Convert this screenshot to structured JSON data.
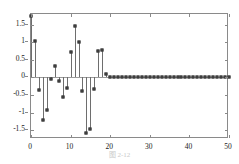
{
  "figure": {
    "caption": "图 2-12",
    "background_color": "#ffffff",
    "frame_color": "#8a8a8a",
    "stem_color": "#6e6e6e",
    "marker_color": "#4a4a4a"
  },
  "chart_data": {
    "type": "bar",
    "subtype": "stem",
    "title": "",
    "subtitle": "",
    "xlabel": "",
    "ylabel": "",
    "xlim": [
      0,
      50
    ],
    "ylim": [
      -1.75,
      1.8
    ],
    "grid": false,
    "legend": null,
    "xticks": [
      0,
      10,
      20,
      30,
      40,
      50
    ],
    "xtick_labels": [
      "0",
      "10",
      "20",
      "30",
      "40",
      "50"
    ],
    "yticks": [
      1.5,
      1,
      0.5,
      0,
      -0.5,
      -1,
      -1.5
    ],
    "ytick_labels": [
      "1.5",
      "1",
      "0.5",
      "0",
      "-0.5",
      "-1",
      "-1.5"
    ],
    "x": [
      0,
      1,
      2,
      3,
      4,
      5,
      6,
      7,
      8,
      9,
      10,
      11,
      12,
      13,
      14,
      15,
      16,
      17,
      18,
      19,
      20,
      21,
      22,
      23,
      24,
      25,
      26,
      27,
      28,
      29,
      30,
      31,
      32,
      33,
      34,
      35,
      36,
      37,
      38,
      39,
      40,
      41,
      42,
      43,
      44,
      45,
      46,
      47,
      48,
      49,
      50
    ],
    "values": [
      1.75,
      1.03,
      -0.35,
      -1.2,
      -0.92,
      -0.06,
      0.32,
      -0.1,
      -0.57,
      -0.31,
      0.72,
      1.47,
      1.01,
      -0.4,
      -1.57,
      -1.48,
      -0.32,
      0.74,
      0.78,
      0.11,
      0,
      0,
      0,
      0,
      0,
      0,
      0,
      0,
      0,
      0,
      0,
      0,
      0,
      0,
      0,
      0,
      0,
      0,
      0,
      0,
      0,
      0,
      0,
      0,
      0,
      0,
      0,
      0,
      0,
      0,
      0
    ],
    "baseline": 0
  }
}
